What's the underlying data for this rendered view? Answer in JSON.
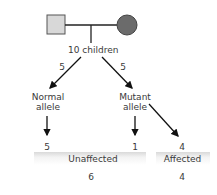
{
  "pedigree": {
    "parent_male": "square",
    "parent_female": "circle-filled",
    "colors": {
      "male_fill": "#d8d8d8",
      "female_fill": "#6b6b6b",
      "line": "#222222"
    }
  },
  "children_label": "10 children",
  "branches": [
    {
      "count": "5",
      "label_line1": "Normal",
      "label_line2": "allele"
    },
    {
      "count": "5",
      "label_line1": "Mutant",
      "label_line2": "allele"
    }
  ],
  "outcomes": {
    "normal_unaffected": "5",
    "mutant_unaffected": "1",
    "mutant_affected": "4"
  },
  "categories": [
    {
      "label": "Unaffected",
      "total": "6"
    },
    {
      "label": "Affected",
      "total": "4"
    }
  ]
}
